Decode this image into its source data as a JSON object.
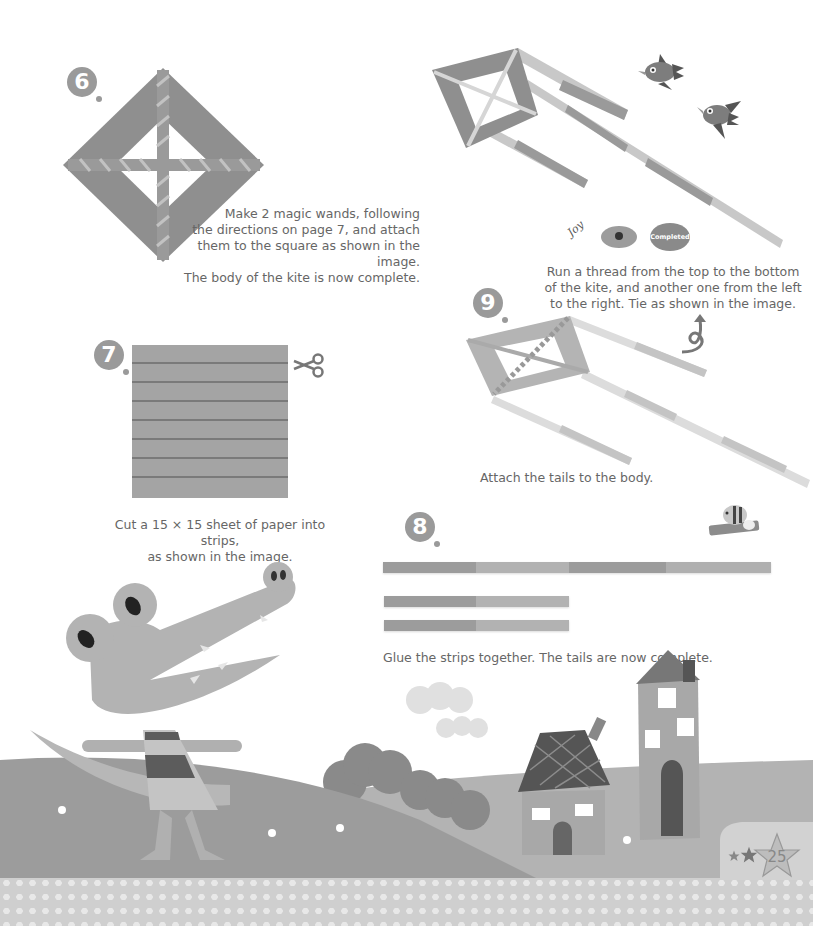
{
  "page": {
    "number": "25",
    "colors": {
      "paper_dark": "#8e8e8e",
      "paper_mid": "#a6a6a6",
      "paper_light": "#c9c9c9",
      "ground": "#a9a9a9",
      "hill": "#999999",
      "footer": "#cfcfcf",
      "text": "#666666"
    }
  },
  "steps": [
    {
      "number": "6",
      "caption_lines": [
        "Make 2 magic wands, following",
        "the directions on page 7, and attach",
        "them to the square as shown in the image.",
        "The body of the kite is now complete."
      ]
    },
    {
      "number": "7",
      "caption_lines": [
        "Cut a 15 × 15 sheet of paper into strips,",
        "as shown in the image."
      ]
    },
    {
      "number": "8",
      "caption_lines": [
        "Glue the strips together. The tails are now complete."
      ]
    },
    {
      "number": "9",
      "caption_lines": [
        "Attach the tails to the body."
      ]
    }
  ],
  "completed_section": {
    "caption_lines": [
      "Run a thread from the top to the bottom",
      "of the kite, and another one from the left",
      "to the right. Tie as shown in the image."
    ],
    "stamp_label": "Completed",
    "signature": "Joy"
  },
  "icons": {
    "scissors": "scissors-icon",
    "glue_bee": "glue-stick-bee-icon",
    "thread_knot": "thread-knot-icon",
    "birds": "bird-icon",
    "crocodile": "crocodile-illustration",
    "houses": "house-illustration",
    "stars": "star-icon"
  }
}
